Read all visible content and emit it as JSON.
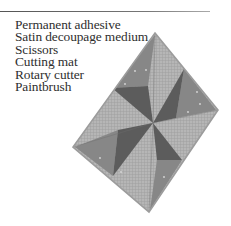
{
  "materials": {
    "items": [
      "Permanent adhesive",
      "Satin decoupage medium",
      "Scissors",
      "Cutting mat",
      "Rotary cutter",
      "Paintbrush"
    ]
  },
  "illustration": {
    "subject": "pinwheel quilt block on diamond",
    "colors": {
      "plaid_light": "#b4b4b4",
      "plaid_grid": "#9a9a9a",
      "mid_triangle": "#858585",
      "dark_triangle": "#5a5a5a",
      "border": "#9c9c9c",
      "dot": "#d8d8d8"
    }
  }
}
